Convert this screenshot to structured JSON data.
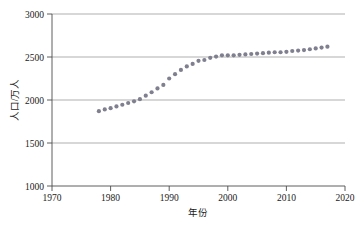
{
  "chart_data": {
    "type": "scatter",
    "title": "",
    "xlabel": "年份",
    "ylabel": "人口/万人",
    "xlim": [
      1970,
      2020
    ],
    "ylim": [
      1000,
      3000
    ],
    "xticks": [
      1970,
      1980,
      1990,
      2000,
      2010,
      2020
    ],
    "xtick_labels": [
      "1970",
      "1980",
      "1990",
      "2000",
      "2010",
      "2020"
    ],
    "yticks": [
      1000,
      1500,
      2000,
      2500,
      3000
    ],
    "ytick_labels": [
      "1000",
      "1500",
      "2000",
      "2500",
      "3000"
    ],
    "grid": "horizontal",
    "legend": "none",
    "marker_color": "#7f7f8f",
    "marker_shape": "circle",
    "series": [
      {
        "name": "人口",
        "x": [
          1978,
          1979,
          1980,
          1981,
          1982,
          1983,
          1984,
          1985,
          1986,
          1987,
          1988,
          1989,
          1990,
          1991,
          1992,
          1993,
          1994,
          1995,
          1996,
          1997,
          1998,
          1999,
          2000,
          2001,
          2002,
          2003,
          2004,
          2005,
          2006,
          2007,
          2008,
          2009,
          2010,
          2011,
          2012,
          2013,
          2014,
          2015,
          2016,
          2017
        ],
        "values": [
          1870,
          1890,
          1905,
          1925,
          1945,
          1965,
          1985,
          2010,
          2050,
          2090,
          2135,
          2175,
          2250,
          2300,
          2350,
          2390,
          2420,
          2455,
          2465,
          2490,
          2505,
          2520,
          2520,
          2520,
          2525,
          2530,
          2535,
          2540,
          2545,
          2550,
          2555,
          2555,
          2560,
          2570,
          2575,
          2580,
          2590,
          2600,
          2610,
          2620
        ]
      }
    ]
  }
}
